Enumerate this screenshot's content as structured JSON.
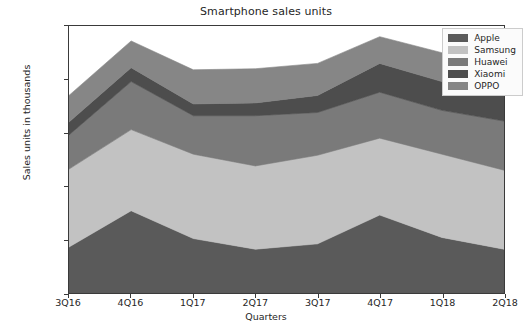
{
  "chart_data": {
    "type": "area",
    "stacked": true,
    "title": "Smartphone sales units",
    "xlabel": "Quarters",
    "ylabel": "Sales units in thousands",
    "categories": [
      "3Q16",
      "4Q16",
      "1Q17",
      "2Q17",
      "3Q17",
      "4Q17",
      "1Q18",
      "2Q18"
    ],
    "ylim": [
      0,
      250000
    ],
    "yticks": [
      0,
      50000,
      100000,
      150000,
      200000,
      250000
    ],
    "ytick_labels": [
      "0",
      "50000",
      "100000",
      "150000",
      "200000",
      "250000"
    ],
    "grid": false,
    "legend_position": "upper right",
    "series": [
      {
        "name": "Apple",
        "color": "#5a5a5a",
        "values": [
          43000,
          77000,
          51000,
          41000,
          46000,
          73000,
          52000,
          41000
        ]
      },
      {
        "name": "Samsung",
        "color": "#c2c2c2",
        "values": [
          73000,
          76000,
          79000,
          78000,
          83000,
          72000,
          78000,
          74000
        ]
      },
      {
        "name": "Huawei",
        "color": "#7a7a7a",
        "values": [
          32000,
          45000,
          36000,
          47000,
          40000,
          43000,
          41000,
          46000
        ]
      },
      {
        "name": "Xiaomi",
        "color": "#4d4d4d",
        "values": [
          12000,
          13000,
          11000,
          12000,
          16000,
          27000,
          27000,
          25000
        ]
      },
      {
        "name": "OPPO",
        "color": "#868686",
        "values": [
          25000,
          25000,
          32000,
          32000,
          30000,
          25000,
          27000,
          24000
        ]
      }
    ],
    "totals": [
      185000,
      236000,
      209000,
      210000,
      215000,
      240000,
      225000,
      210000
    ]
  },
  "axes": {
    "y_label": "Sales units in thousands",
    "x_label": "Quarters"
  }
}
